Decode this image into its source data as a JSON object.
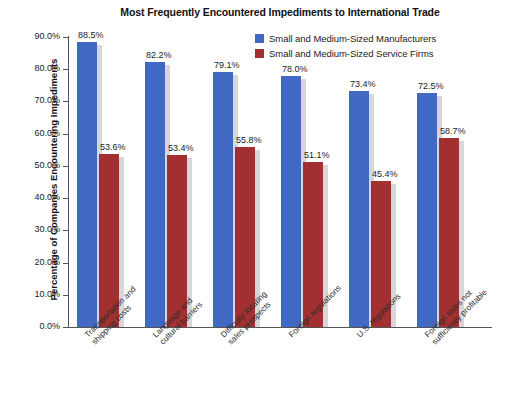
{
  "chart_data": {
    "type": "bar",
    "title": "Most Frequently Encountered Impediments to International Trade",
    "xlabel": "",
    "ylabel": "Percentage of Companies Encountering Impediments",
    "ylim": [
      0,
      90
    ],
    "ytick_step": 10,
    "grid": false,
    "legend_position": "top-right",
    "ytick_labels": [
      "0.0%",
      "10.0%",
      "20.0%",
      "30.0%",
      "40.0%",
      "50.0%",
      "60.0%",
      "70.0%",
      "80.0%",
      "90.0%"
    ],
    "ytick_values": [
      0,
      10,
      20,
      30,
      40,
      50,
      60,
      70,
      80,
      90
    ],
    "categories": [
      "Transportation and shipping costs",
      "Language and cultural barriers",
      "Difficulty locating sales prospects",
      "Foreign regulations",
      "U.S. regulations",
      "Foreign sales not sufficiently profitable"
    ],
    "category_lines": [
      [
        "Transportation and",
        "shipping costs"
      ],
      [
        "Language and",
        "cultural barriers"
      ],
      [
        "Difficulty locating",
        "sales prospects"
      ],
      [
        "Foreign regulations",
        ""
      ],
      [
        "U.S. regulations",
        ""
      ],
      [
        "Foreign sales not",
        "sufficiently profitable"
      ]
    ],
    "series": [
      {
        "name": "Small and Medium-Sized Manufacturers",
        "color": "#4169c4",
        "values": [
          88.5,
          82.2,
          79.1,
          78.0,
          73.4,
          72.5
        ],
        "labels": [
          "88.5%",
          "82.2%",
          "79.1%",
          "78.0%",
          "73.4%",
          "72.5%"
        ]
      },
      {
        "name": "Small and Medium-Sized Service Firms",
        "color": "#a33030",
        "values": [
          53.6,
          53.4,
          55.8,
          51.1,
          45.4,
          58.7
        ],
        "labels": [
          "53.6%",
          "53.4%",
          "55.8%",
          "51.1%",
          "45.4%",
          "58.7%"
        ]
      }
    ]
  },
  "colors": {
    "series_manufacturers": "#4169c4",
    "series_service_firms": "#a33030",
    "axis": "#555555",
    "text": "#1b1b1b",
    "bar_shadow": "#c9c9cf",
    "background": "#ffffff"
  }
}
